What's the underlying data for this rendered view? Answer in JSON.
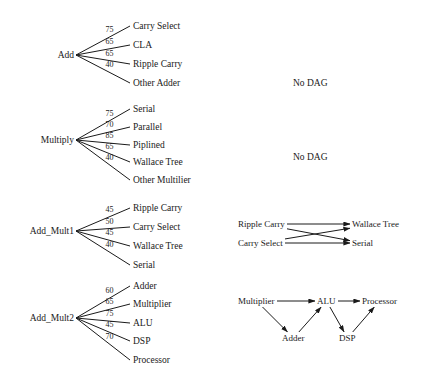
{
  "figure": {
    "type": "diagram"
  },
  "trees": [
    {
      "id": "tree-add",
      "root": "Add",
      "root_x": 48,
      "root_y": 55,
      "fan_x": 76,
      "leaf_x": 133,
      "children": [
        {
          "label": "Carry Select",
          "weight": "75",
          "y": 21
        },
        {
          "label": "CLA",
          "weight": "65",
          "y": 40
        },
        {
          "label": "Ripple Carry",
          "weight": "65",
          "y": 59
        },
        {
          "label": "Other Adder",
          "weight": "40",
          "y": 78
        }
      ]
    },
    {
      "id": "tree-multiply",
      "root": "Multiply",
      "root_x": 35,
      "root_y": 140,
      "fan_x": 76,
      "leaf_x": 133,
      "children": [
        {
          "label": "Serial",
          "weight": "75",
          "y": 104
        },
        {
          "label": "Parallel",
          "weight": "70",
          "y": 122
        },
        {
          "label": "Piplined",
          "weight": "85",
          "y": 140
        },
        {
          "label": "Wallace Tree",
          "weight": "65",
          "y": 157
        },
        {
          "label": "Other Multilier",
          "weight": "40",
          "y": 175
        }
      ]
    },
    {
      "id": "tree-add-mult1",
      "root": "Add_Mult1",
      "root_x": 21,
      "root_y": 231,
      "fan_x": 76,
      "leaf_x": 133,
      "children": [
        {
          "label": "Ripple Carry",
          "weight": "45",
          "y": 203
        },
        {
          "label": "Carry Select",
          "weight": "50",
          "y": 222
        },
        {
          "label": "Wallace Tree",
          "weight": "45",
          "y": 241
        },
        {
          "label": "Serial",
          "weight": "40",
          "y": 260
        }
      ]
    },
    {
      "id": "tree-add-mult2",
      "root": "Add_Mult2",
      "root_x": 21,
      "root_y": 318,
      "fan_x": 76,
      "leaf_x": 133,
      "children": [
        {
          "label": "Adder",
          "weight": "60",
          "y": 281
        },
        {
          "label": "Multiplier",
          "weight": "65",
          "y": 299
        },
        {
          "label": "ALU",
          "weight": "75",
          "y": 318
        },
        {
          "label": "DSP",
          "weight": "45",
          "y": 336
        },
        {
          "label": "Processor",
          "weight": "70",
          "y": 355
        }
      ]
    }
  ],
  "no_dag_labels": [
    {
      "text": "No DAG",
      "x": 293,
      "y": 78
    },
    {
      "text": "No DAG",
      "x": 293,
      "y": 152
    }
  ],
  "dags": [
    {
      "id": "dag-mult1",
      "nodes": [
        {
          "name": "Ripple Carry",
          "x": 238,
          "y": 219
        },
        {
          "name": "Carry Select",
          "x": 238,
          "y": 238
        },
        {
          "name": "Wallace Tree",
          "x": 352,
          "y": 219
        },
        {
          "name": "Serial",
          "x": 352,
          "y": 238
        }
      ],
      "edges": [
        {
          "from": "Ripple Carry",
          "to": "Wallace Tree"
        },
        {
          "from": "Ripple Carry",
          "to": "Serial"
        },
        {
          "from": "Carry Select",
          "to": "Wallace Tree"
        },
        {
          "from": "Carry Select",
          "to": "Serial"
        }
      ]
    },
    {
      "id": "dag-mult2",
      "nodes": [
        {
          "name": "Multiplier",
          "x": 238,
          "y": 296
        },
        {
          "name": "ALU",
          "x": 317,
          "y": 296
        },
        {
          "name": "Processor",
          "x": 362,
          "y": 296
        },
        {
          "name": "Adder",
          "x": 282,
          "y": 333
        },
        {
          "name": "DSP",
          "x": 339,
          "y": 333
        }
      ],
      "edges": [
        {
          "from": "Multiplier",
          "to": "ALU"
        },
        {
          "from": "ALU",
          "to": "Processor"
        },
        {
          "from": "Multiplier",
          "to": "Adder"
        },
        {
          "from": "Adder",
          "to": "ALU"
        },
        {
          "from": "ALU",
          "to": "DSP"
        },
        {
          "from": "DSP",
          "to": "Processor"
        }
      ]
    }
  ]
}
